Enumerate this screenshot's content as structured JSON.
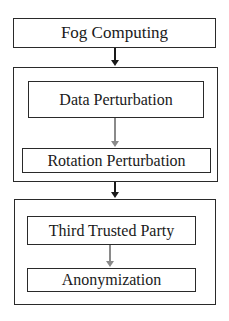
{
  "diagram": {
    "type": "flowchart",
    "direction": "top-to-bottom",
    "nodes": {
      "fog_computing": "Fog Computing",
      "data_perturbation": "Data Perturbation",
      "rotation_perturbation": "Rotation Perturbation",
      "third_trusted_party": "Third Trusted Party",
      "anonymization": "Anonymization"
    },
    "groups": [
      {
        "name": "perturbation-group",
        "members": [
          "Data Perturbation",
          "Rotation Perturbation"
        ]
      },
      {
        "name": "trusted-party-group",
        "members": [
          "Third Trusted Party",
          "Anonymization"
        ]
      }
    ],
    "edges": [
      {
        "from": "Fog Computing",
        "to": "perturbation-group",
        "color": "#1a1a1a"
      },
      {
        "from": "Data Perturbation",
        "to": "Rotation Perturbation",
        "color": "#8a8a8a"
      },
      {
        "from": "perturbation-group",
        "to": "trusted-party-group",
        "color": "#1a1a1a"
      },
      {
        "from": "Third Trusted Party",
        "to": "Anonymization",
        "color": "#8a8a8a"
      }
    ]
  }
}
